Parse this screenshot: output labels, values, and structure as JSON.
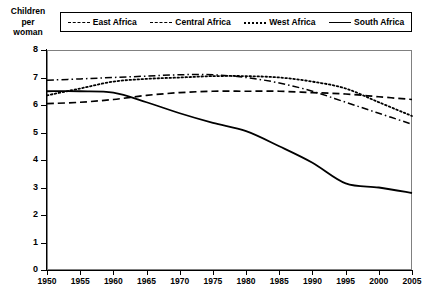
{
  "chart_data": {
    "type": "line",
    "title": "",
    "xlabel": "",
    "ylabel": "Children per woman",
    "xlim": [
      1950,
      2005
    ],
    "ylim": [
      0,
      8
    ],
    "grid": false,
    "legend_position": "top",
    "x": [
      1950,
      1955,
      1960,
      1965,
      1970,
      1975,
      1980,
      1985,
      1990,
      1995,
      2000,
      2005
    ],
    "xticklabels": [
      "1950",
      "1955",
      "1960",
      "1965",
      "1970",
      "1975",
      "1980",
      "1985",
      "1990",
      "1995",
      "2000",
      "2005"
    ],
    "yticklabels": [
      "0",
      "1",
      "2",
      "3",
      "4",
      "5",
      "6",
      "7",
      "8"
    ],
    "series": [
      {
        "name": "East Africa",
        "style": "dash-dot",
        "values": [
          6.9,
          6.95,
          7.0,
          7.05,
          7.1,
          7.1,
          7.0,
          6.8,
          6.5,
          6.1,
          5.7,
          5.3
        ]
      },
      {
        "name": "Central Africa",
        "style": "dashed",
        "values": [
          6.05,
          6.1,
          6.2,
          6.35,
          6.45,
          6.5,
          6.5,
          6.5,
          6.45,
          6.4,
          6.3,
          6.2
        ]
      },
      {
        "name": "West Africa",
        "style": "dotted",
        "values": [
          6.35,
          6.6,
          6.85,
          6.95,
          7.0,
          7.05,
          7.05,
          7.0,
          6.85,
          6.6,
          6.1,
          5.6
        ]
      },
      {
        "name": "South Africa",
        "style": "solid",
        "values": [
          6.5,
          6.5,
          6.45,
          6.1,
          5.7,
          5.35,
          5.05,
          4.5,
          3.9,
          3.15,
          3.0,
          2.8
        ]
      }
    ]
  },
  "axis_title": {
    "line1": "Children",
    "line2": "per",
    "line3": "woman"
  },
  "legend": {
    "items": [
      {
        "label": "East Africa"
      },
      {
        "label": "Central Africa"
      },
      {
        "label": "West Africa"
      },
      {
        "label": "South Africa"
      }
    ]
  }
}
